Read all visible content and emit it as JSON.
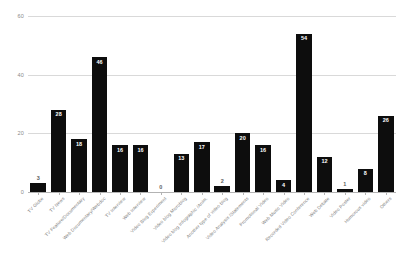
{
  "chart_data": {
    "type": "bar",
    "title": "",
    "xlabel": "",
    "ylabel": "",
    "ylim": [
      0,
      60
    ],
    "yticks": [
      0,
      20,
      40,
      60
    ],
    "grid": true,
    "legend": false,
    "bar_color": "#0d0d0d",
    "gridline_color": "#d9d9d9",
    "label_color": "#7d7d7d",
    "categories": [
      "TV Globe",
      "TV News",
      "TV Feature/Documentary",
      "Web Documentary/Webdoc",
      "TV Interview",
      "Web Interview",
      "Video Blog Experiment",
      "Video blog Microblog",
      "Video blog Infographic /Anim.",
      "Another type of video blog",
      "Video Analysis /Statements",
      "Promotional Video",
      "Web Music Video",
      "Recorded Video Conference",
      "Web Debate",
      "Video Poster",
      "Humorous video",
      "Others"
    ],
    "values": [
      3,
      28,
      18,
      46,
      16,
      16,
      0,
      13,
      17,
      2,
      20,
      16,
      4,
      54,
      12,
      1,
      8,
      26
    ],
    "value_labels": [
      "3",
      "28",
      "18",
      "46",
      "16",
      "16",
      "0",
      "13",
      "17",
      "2",
      "20",
      "16",
      "4",
      "54",
      "12",
      "1",
      "8",
      "26"
    ]
  }
}
